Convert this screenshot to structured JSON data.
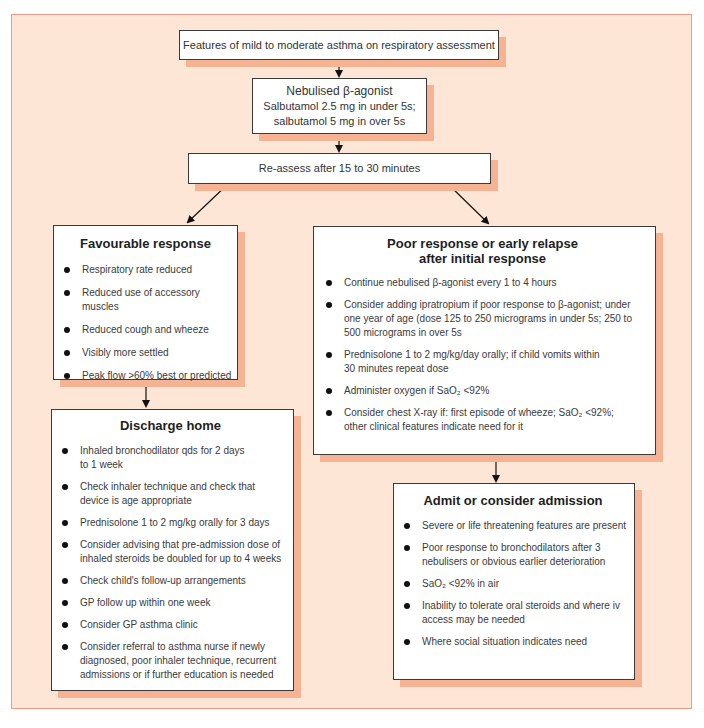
{
  "colors": {
    "panel_background": "#fde6d6",
    "panel_border": "#ec9a86",
    "box_shadow": "#f6b393",
    "box_border": "#3a3a3a"
  },
  "flowchart": {
    "start": {
      "text": "Features of mild to moderate asthma on respiratory assessment"
    },
    "treatment": {
      "line1": "Nebulised β-agonist",
      "line2": "Salbutamol 2.5 mg in under 5s;",
      "line3": "salbutamol 5 mg in over 5s"
    },
    "reassess": {
      "text": "Re-assess after 15 to 30 minutes"
    },
    "favourable": {
      "title": "Favourable response",
      "items": [
        "Respiratory rate reduced",
        "Reduced use of accessory muscles",
        "Reduced cough and wheeze",
        "Visibly more settled",
        "Peak flow >60% best or predicted"
      ]
    },
    "poor": {
      "title_line1": "Poor response or early relapse",
      "title_line2": "after initial response",
      "items": [
        "Continue nebulised β-agonist every 1 to 4 hours",
        "Consider adding ipratropium if poor response to β-agonist; under one year of age (dose 125 to 250 micrograms in under 5s; 250 to 500 micrograms in over 5s",
        "Prednisolone 1 to 2 mg/kg/day orally; if child vomits within 30 minutes repeat dose",
        "Administer oxygen if SaO₂ <92%",
        "Consider chest X-ray if: first episode of wheeze; SaO₂ <92%; other clinical features indicate need for it"
      ]
    },
    "discharge": {
      "title": "Discharge home",
      "items": [
        "Inhaled bronchodilator qds for 2 days to 1 week",
        "Check inhaler technique and check that device is age appropriate",
        "Prednisolone 1 to 2 mg/kg orally for 3 days",
        "Consider advising that pre-admission dose of inhaled steroids be doubled for up to 4 weeks",
        "Check child's follow-up arrangements",
        "GP follow up within one week",
        "Consider GP asthma clinic",
        "Consider referral to asthma nurse if newly diagnosed, poor inhaler technique, recurrent admissions or if further education is needed"
      ]
    },
    "admit": {
      "title": "Admit or consider admission",
      "items": [
        "Severe or life threatening features are present",
        "Poor response to bronchodilators after 3 nebulisers or obvious earlier deterioration",
        "SaO₂ <92% in air",
        "Inability to tolerate oral steroids and where iv access may be needed",
        "Where social situation indicates need"
      ]
    }
  }
}
